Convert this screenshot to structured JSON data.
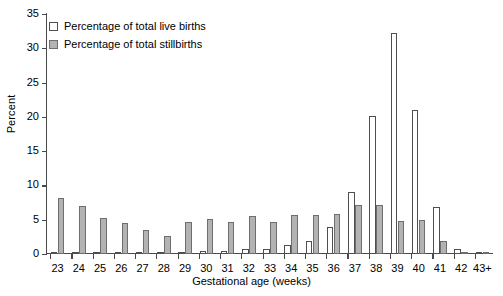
{
  "chart_data": {
    "type": "bar",
    "title": "",
    "xlabel": "Gestational age (weeks)",
    "ylabel": "Percent",
    "categories": [
      "23",
      "24",
      "25",
      "26",
      "27",
      "28",
      "29",
      "30",
      "31",
      "32",
      "33",
      "34",
      "35",
      "36",
      "37",
      "38",
      "39",
      "40",
      "41",
      "42",
      "43+"
    ],
    "series": [
      {
        "name": "Percentage of total live births",
        "color": "#ffffff",
        "values": [
          0.15,
          0.2,
          0.15,
          0.2,
          0.3,
          0.3,
          0.25,
          0.45,
          0.5,
          0.7,
          0.8,
          1.3,
          1.9,
          3.9,
          9.0,
          20.2,
          32.2,
          21.0,
          6.9,
          0.7,
          0.15
        ]
      },
      {
        "name": "Percentage of total stillbirths",
        "color": "#b3b3b3",
        "values": [
          8.1,
          7.0,
          5.2,
          4.5,
          3.5,
          2.6,
          4.7,
          5.1,
          4.7,
          5.6,
          4.6,
          5.7,
          5.7,
          5.8,
          7.2,
          7.1,
          4.8,
          4.9,
          1.9,
          0.35,
          0.15
        ]
      }
    ],
    "ylim": [
      0,
      35
    ],
    "yticks": [
      0,
      5,
      10,
      15,
      20,
      25,
      30,
      35
    ],
    "grid": false,
    "legend_position": "top-left"
  },
  "legend": {
    "items": [
      {
        "label": "Percentage of total live births",
        "swatch": "live"
      },
      {
        "label": "Percentage of total stillbirths",
        "swatch": "still"
      }
    ]
  }
}
